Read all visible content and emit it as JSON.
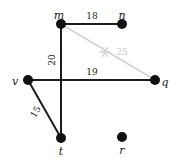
{
  "figure": {
    "type": "graph-diagram",
    "background_color": "#ffffff",
    "width": 176,
    "height": 163
  },
  "chart_data": {
    "type": "diagram",
    "title": "",
    "nodes": [
      {
        "id": "m",
        "label": "m",
        "x": 61,
        "y": 24,
        "color": "#111111",
        "radius": 5.0,
        "label_dx": -2,
        "label_dy": -8
      },
      {
        "id": "n",
        "label": "n",
        "x": 122,
        "y": 24,
        "color": "#111111",
        "radius": 5.0,
        "label_dx": 0,
        "label_dy": -8
      },
      {
        "id": "v",
        "label": "v",
        "x": 28,
        "y": 80,
        "color": "#111111",
        "radius": 5.0,
        "label_dx": -13,
        "label_dy": 2
      },
      {
        "id": "q",
        "label": "q",
        "x": 155,
        "y": 80,
        "color": "#111111",
        "radius": 5.0,
        "label_dx": 10,
        "label_dy": 3
      },
      {
        "id": "t",
        "label": "t",
        "x": 61,
        "y": 138,
        "color": "#111111",
        "radius": 5.0,
        "label_dx": 0,
        "label_dy": 14
      },
      {
        "id": "r",
        "label": "r",
        "x": 122,
        "y": 137,
        "color": "#111111",
        "radius": 5.0,
        "label_dx": 0,
        "label_dy": 14
      }
    ],
    "edges": [
      {
        "id": "m-n",
        "source": "m",
        "target": "n",
        "weight": "18",
        "color": "#1c1c1c",
        "width": 2.0,
        "label_x": 92,
        "label_y": 16,
        "rotation": 0,
        "faded": false
      },
      {
        "id": "m-q",
        "source": "m",
        "target": "q",
        "weight": "25",
        "color": "#d2d2d2",
        "width": 1.6,
        "label_x": 122,
        "label_y": 52,
        "rotation": 0,
        "faded": true
      },
      {
        "id": "m-t",
        "source": "m",
        "target": "t",
        "weight": "20",
        "color": "#1c1c1c",
        "width": 2.0,
        "label_x": 52,
        "label_y": 60,
        "rotation": -90,
        "faded": false
      },
      {
        "id": "v-q",
        "source": "v",
        "target": "q",
        "weight": "19",
        "color": "#1c1c1c",
        "width": 2.0,
        "label_x": 92,
        "label_y": 72,
        "rotation": 0,
        "faded": false
      },
      {
        "id": "v-t",
        "source": "v",
        "target": "t",
        "weight": "15",
        "color": "#1c1c1c",
        "width": 2.0,
        "label_x": 36,
        "label_y": 112,
        "rotation": -60,
        "faded": false
      }
    ],
    "markers": [
      {
        "id": "star-on-mq",
        "symbol": "asterisk",
        "x": 105,
        "y": 52,
        "color": "#d8d8d8",
        "size": 11
      }
    ]
  }
}
